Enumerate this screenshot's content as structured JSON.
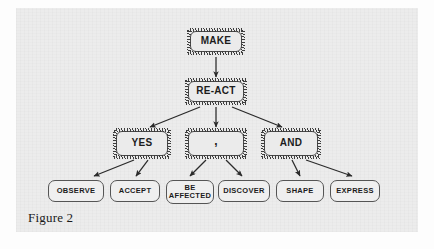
{
  "figure": {
    "caption": "Figure 2",
    "background_color": "#ececec",
    "page_color": "#fdfdfd",
    "ink_color": "#1c1c1c",
    "box_fill": "#ebebeb",
    "leaf_fill": "#efefef"
  },
  "diagram": {
    "type": "tree",
    "orientation": "top-down",
    "levels": [
      {
        "level": 1,
        "nodes": [
          {
            "id": "make",
            "label": "MAKE",
            "style": "shaded"
          }
        ]
      },
      {
        "level": 2,
        "nodes": [
          {
            "id": "react",
            "label": "RE-ACT",
            "style": "shaded"
          }
        ]
      },
      {
        "level": 3,
        "nodes": [
          {
            "id": "yes",
            "label": "YES",
            "style": "shaded"
          },
          {
            "id": "comma",
            "label": ",",
            "style": "shaded"
          },
          {
            "id": "and",
            "label": "AND",
            "style": "shaded"
          }
        ]
      },
      {
        "level": 4,
        "nodes": [
          {
            "id": "observe",
            "label": "OBSERVE",
            "style": "leaf"
          },
          {
            "id": "accept",
            "label": "ACCEPT",
            "style": "leaf"
          },
          {
            "id": "be_affected",
            "label": "BE\nAFFECTED",
            "style": "leaf"
          },
          {
            "id": "discover",
            "label": "DISCOVER",
            "style": "leaf"
          },
          {
            "id": "shape",
            "label": "SHAPE",
            "style": "leaf"
          },
          {
            "id": "express",
            "label": "EXPRESS",
            "style": "leaf"
          }
        ]
      }
    ],
    "edges": [
      {
        "from": "make",
        "to": "react"
      },
      {
        "from": "react",
        "to": "yes"
      },
      {
        "from": "react",
        "to": "comma"
      },
      {
        "from": "react",
        "to": "and"
      },
      {
        "from": "yes",
        "to": "observe"
      },
      {
        "from": "yes",
        "to": "accept"
      },
      {
        "from": "comma",
        "to": "be_affected"
      },
      {
        "from": "comma",
        "to": "discover"
      },
      {
        "from": "and",
        "to": "shape"
      },
      {
        "from": "and",
        "to": "express"
      }
    ]
  }
}
